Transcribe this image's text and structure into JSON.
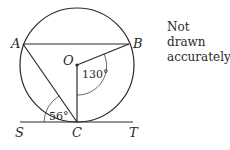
{
  "diagram": {
    "note_line1": "Not drawn",
    "note_line2": "accurately",
    "points": {
      "A": "A",
      "B": "B",
      "O": "O",
      "C": "C",
      "S": "S",
      "T": "T"
    },
    "angles": {
      "BOC": "130°",
      "SCA": "56°"
    },
    "colors": {
      "stroke": "#2a2a2a",
      "background": "#ffffff"
    }
  }
}
